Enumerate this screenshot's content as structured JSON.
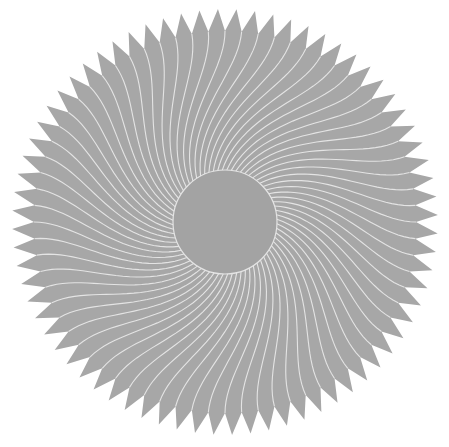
{
  "figure": {
    "type": "spiral-sawtooth-rosette",
    "width": 449,
    "height": 447,
    "background": "#ffffff",
    "center": [
      225,
      222
    ],
    "teeth_count": 72,
    "outer_radius": 213,
    "valley_radius": 191,
    "hub_radius": 52,
    "fill_color": "#a7a7a7",
    "hub_color": "#a3a3a3",
    "line_color": "#e4e4e4",
    "line_width": 1.1,
    "spiral_twist_degrees": 38
  }
}
